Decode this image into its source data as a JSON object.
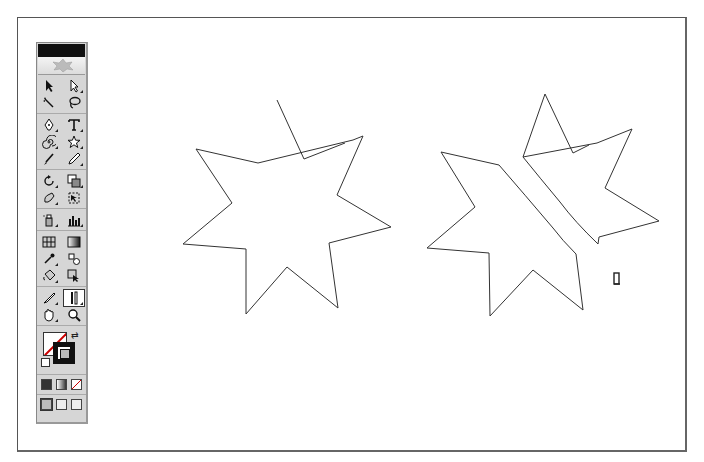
{
  "window": {
    "title": ""
  },
  "toolbox": {
    "title_color": "#111111",
    "rows": [
      [
        "selection-tool",
        "direct-selection-tool"
      ],
      [
        "magic-wand-tool",
        "lasso-tool"
      ],
      [
        "pen-tool",
        "type-tool"
      ],
      [
        "spiral-tool",
        "star-tool"
      ],
      [
        "paintbrush-tool",
        "pencil-tool"
      ],
      [
        "rotate-tool",
        "scale-tool"
      ],
      [
        "warp-tool",
        "free-transform-tool"
      ],
      [
        "symbol-sprayer-tool",
        "graph-tool"
      ],
      [
        "mesh-tool",
        "gradient-tool"
      ],
      [
        "eyedropper-tool",
        "blend-tool"
      ],
      [
        "live-paint-bucket-tool",
        "live-paint-selection-tool"
      ],
      [
        "knife-tool",
        "scissors-tool"
      ],
      [
        "hand-tool",
        "zoom-tool"
      ]
    ],
    "selected_tool": "scissors-tool",
    "fill_color": "none",
    "stroke_color": "#111111",
    "color_modes": [
      "color",
      "gradient",
      "none"
    ],
    "screen_modes": [
      "standard-screen",
      "full-screen-menu",
      "full-screen"
    ]
  },
  "canvas": {
    "background": "#ffffff",
    "stroke": "#333333",
    "star_original": "277,100 304,159 345,143 M353,140 363,136 337,195 391,227 329,243 338,308 287,267 246,314 246,249 183,244 232,203 196,149 258,163 277,100",
    "star_cut_right": "523,157 545,94 573,153 589,145 M597,143 632,129 605,188 659,221 599,237 598,244 587,235 560,202 523,157",
    "star_cut_left": "499,165 441,152 475,207 427,248 489,253 490,316 533,270 583,310 576,254 553,228 499,165",
    "cursor": {
      "x": 617,
      "y": 280,
      "icon": "scissors-cursor"
    }
  }
}
